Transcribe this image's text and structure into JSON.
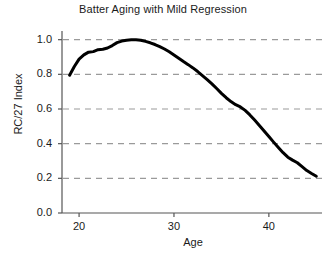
{
  "chart_data": {
    "type": "line",
    "title": "Batter Aging with Mild Regression",
    "xlabel": "Age",
    "ylabel": "RC/27 Index",
    "xlim": [
      18.2,
      45.6
    ],
    "ylim": [
      0.0,
      1.05
    ],
    "xticks": [
      20,
      30,
      40
    ],
    "xtick_labels": [
      "20",
      "30",
      "40"
    ],
    "yticks": [
      0.0,
      0.2,
      0.4,
      0.6,
      0.8,
      1.0
    ],
    "ytick_labels": [
      "0.0",
      "0.2",
      "0.4",
      "0.6",
      "0.8",
      "1.0"
    ],
    "grid": "horizontal-dashed",
    "legend": "none",
    "line_color": "#000000",
    "line_width": 3,
    "grid_color": "#9a9a9a",
    "axis_color": "#555555",
    "background": "#ffffff",
    "series": [
      {
        "name": "RC/27 Index",
        "x": [
          19.0,
          19.5,
          20.0,
          20.5,
          21.0,
          21.5,
          22.0,
          22.5,
          23.0,
          23.5,
          24.0,
          24.5,
          25.0,
          25.5,
          26.0,
          26.5,
          27.0,
          27.5,
          28.0,
          28.5,
          29.0,
          29.5,
          30.0,
          30.5,
          31.0,
          31.5,
          32.0,
          32.5,
          33.0,
          33.5,
          34.0,
          34.5,
          35.0,
          35.5,
          36.0,
          36.5,
          37.0,
          37.5,
          38.0,
          38.5,
          39.0,
          39.5,
          40.0,
          40.5,
          41.0,
          41.5,
          42.0,
          42.5,
          43.0,
          43.5,
          44.0,
          44.5,
          45.0
        ],
        "y": [
          0.795,
          0.845,
          0.888,
          0.912,
          0.928,
          0.931,
          0.942,
          0.945,
          0.952,
          0.966,
          0.983,
          0.992,
          0.997,
          0.999,
          1.0,
          0.997,
          0.99,
          0.982,
          0.972,
          0.96,
          0.946,
          0.93,
          0.912,
          0.893,
          0.874,
          0.856,
          0.837,
          0.816,
          0.793,
          0.77,
          0.745,
          0.718,
          0.69,
          0.665,
          0.643,
          0.625,
          0.612,
          0.592,
          0.566,
          0.536,
          0.505,
          0.473,
          0.441,
          0.409,
          0.378,
          0.348,
          0.322,
          0.305,
          0.29,
          0.268,
          0.245,
          0.228,
          0.212
        ]
      }
    ]
  }
}
